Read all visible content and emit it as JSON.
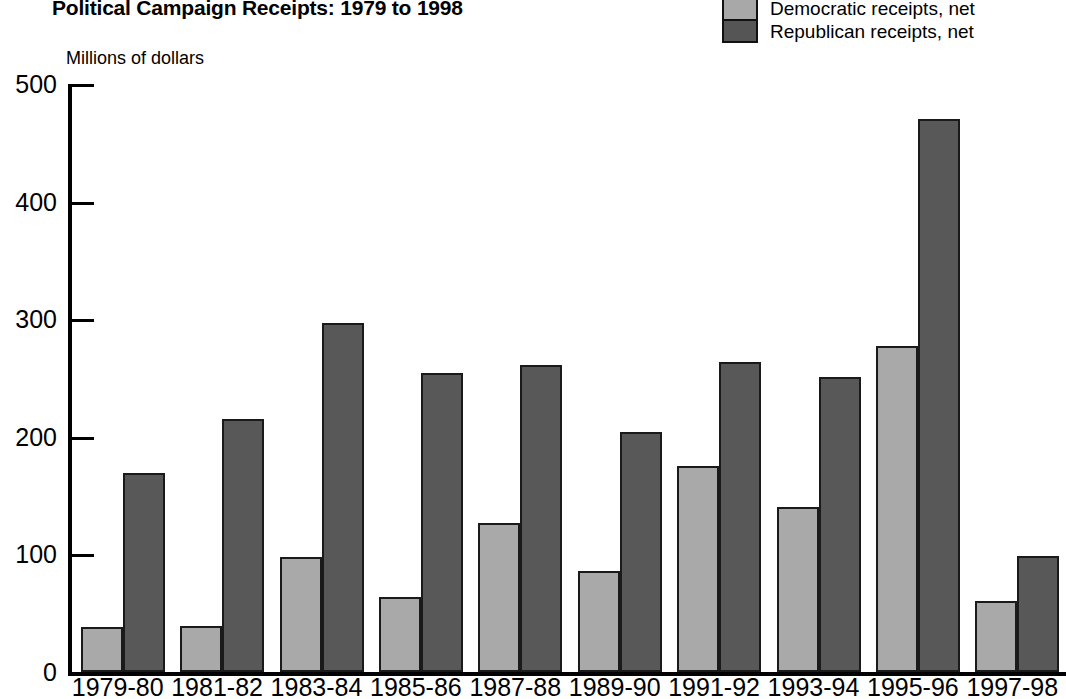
{
  "chart_data": {
    "type": "bar",
    "title": "Political Campaign Receipts: 1979 to 1998",
    "ylabel": "Millions of dollars",
    "xlabel": "",
    "ylim": [
      0,
      500
    ],
    "yticks": [
      0,
      100,
      200,
      300,
      400,
      500
    ],
    "ytick_labels": [
      "0",
      "100",
      "200",
      "300",
      "400",
      "500"
    ],
    "grid": false,
    "legend_position": "top-right",
    "categories": [
      "1979-80",
      "1981-82",
      "1983-84",
      "1985-86",
      "1987-88",
      "1989-90",
      "1991-92",
      "1993-94",
      "1995-96",
      "1997-98"
    ],
    "series": [
      {
        "name": "Democratic receipts, net",
        "color": "#a9a9a9",
        "values": [
          38,
          39,
          98,
          64,
          127,
          86,
          175,
          140,
          277,
          60
        ]
      },
      {
        "name": "Republican receipts, net",
        "color": "#585858",
        "values": [
          169,
          215,
          297,
          254,
          261,
          204,
          264,
          251,
          470,
          99
        ]
      }
    ]
  }
}
